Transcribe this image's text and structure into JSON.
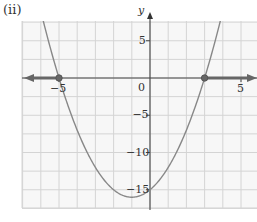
{
  "panel_label": "(ii)",
  "chart_data": {
    "type": "line",
    "title": "",
    "xlabel": "",
    "ylabel": "y",
    "function": "y = x^2 + 2x - 15",
    "xlim": [
      -7,
      6
    ],
    "ylim": [
      -17,
      7.5
    ],
    "x_ticks": [
      -5,
      5
    ],
    "x_tick_labels": [
      "-5",
      "5"
    ],
    "y_ticks": [
      5,
      0,
      -5,
      -10,
      -15
    ],
    "y_tick_labels": [
      "5",
      "0",
      "-5",
      "-10",
      "-15"
    ],
    "grid": true,
    "series": [
      {
        "name": "parabola",
        "x": [
          -7,
          -6,
          -5,
          -4,
          -3,
          -2,
          -1,
          0,
          1,
          2,
          3,
          4
        ],
        "y": [
          20,
          9,
          0,
          -7,
          -12,
          -15,
          -16,
          -15,
          -12,
          -7,
          0,
          9
        ]
      }
    ],
    "marked_points": [
      {
        "x": -5,
        "y": 0
      },
      {
        "x": 3,
        "y": 0
      }
    ],
    "annotations": [
      "Solution set shaded on x-axis: x <= -5 and x >= 3 (arrows extending left and right)"
    ]
  }
}
